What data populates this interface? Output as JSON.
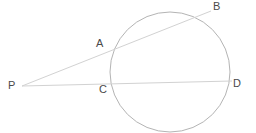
{
  "diagram": {
    "background_color": "#ffffff",
    "stroke_color": "#b4b4b4",
    "label_color": "#4a4a4a",
    "labels": {
      "p": "P",
      "a": "A",
      "b": "B",
      "c": "C",
      "d": "D"
    }
  },
  "chart_data": {
    "type": "diagram",
    "xlim": [
      0,
      256
    ],
    "ylim": [
      0,
      133
    ],
    "grid": false,
    "legend": null,
    "shapes": [
      {
        "name": "circle",
        "kind": "circle",
        "cx": 170,
        "cy": 72,
        "r": 60,
        "stroke": "#b4b4b4",
        "stroke_width": 1,
        "fill": "none"
      },
      {
        "name": "secant-p-b",
        "kind": "line",
        "x1": 22,
        "y1": 86,
        "x2": 211,
        "y2": 11,
        "stroke": "#d2d2d2",
        "stroke_width": 1
      },
      {
        "name": "secant-p-d",
        "kind": "line",
        "x1": 22,
        "y1": 86,
        "x2": 232,
        "y2": 81,
        "stroke": "#d2d2d2",
        "stroke_width": 1
      }
    ],
    "points": [
      {
        "name": "P",
        "label": "P",
        "x": 22,
        "y": 86,
        "label_x": 8,
        "label_y": 80,
        "on_circle": false
      },
      {
        "name": "A",
        "label": "A",
        "x": 112,
        "y": 50,
        "label_x": 96,
        "label_y": 38,
        "on_circle": true
      },
      {
        "name": "B",
        "label": "B",
        "x": 211,
        "y": 11,
        "label_x": 213,
        "label_y": 1,
        "on_circle": true
      },
      {
        "name": "C",
        "label": "C",
        "x": 112,
        "y": 84,
        "label_x": 99,
        "label_y": 84,
        "on_circle": true
      },
      {
        "name": "D",
        "label": "D",
        "x": 230,
        "y": 81,
        "label_x": 233,
        "label_y": 78,
        "on_circle": true
      }
    ]
  }
}
